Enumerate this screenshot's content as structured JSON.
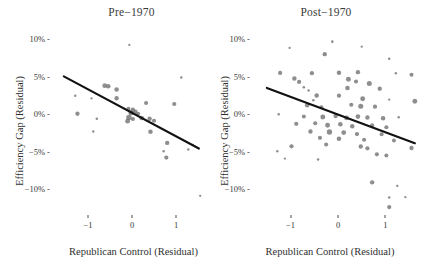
{
  "chart_data": {
    "type": "scatter",
    "title": "",
    "xlabel": "Republican Control (Residual)",
    "ylabel": "Efficiency Gap (Residual)",
    "grid": false,
    "legend": "none",
    "xlim": [
      -1.75,
      1.75
    ],
    "ylim": [
      -0.13,
      0.115
    ],
    "xticks": [
      -1,
      0,
      1
    ],
    "xtick_labels": [
      "−1",
      "0",
      "1"
    ],
    "yticks": [
      0.1,
      0.05,
      0.0,
      -0.05,
      -0.1
    ],
    "ytick_labels": [
      "10%",
      "5%",
      "0%",
      "−5%",
      "−10%"
    ],
    "point_color": "#6e6e6e",
    "point_opacity": 0.78,
    "line_color": "#111111",
    "note": "Bubble area encodes case weight; black line is fitted regression.",
    "panels": [
      {
        "id": "pre",
        "title": "Pre−1970",
        "fit_line": {
          "x1": -1.55,
          "y1": 0.0505,
          "x2": 1.52,
          "y2": -0.0455
        },
        "points": [
          {
            "x": -0.06,
            "y": 0.0925,
            "w": 1.0
          },
          {
            "x": 1.12,
            "y": 0.0492,
            "w": 1.2
          },
          {
            "x": -1.29,
            "y": 0.0248,
            "w": 1.1
          },
          {
            "x": -0.62,
            "y": 0.0382,
            "w": 4.2
          },
          {
            "x": -0.54,
            "y": 0.0375,
            "w": 4.0
          },
          {
            "x": -0.35,
            "y": 0.0332,
            "w": 3.8
          },
          {
            "x": -0.35,
            "y": 0.0215,
            "w": 3.6
          },
          {
            "x": -0.92,
            "y": 0.0212,
            "w": 1.0
          },
          {
            "x": 0.96,
            "y": 0.0138,
            "w": 3.4
          },
          {
            "x": 0.32,
            "y": 0.0152,
            "w": 3.2
          },
          {
            "x": -1.24,
            "y": 0.0008,
            "w": 3.5
          },
          {
            "x": -0.08,
            "y": 0.0075,
            "w": 3.0
          },
          {
            "x": 0.02,
            "y": 0.0062,
            "w": 3.6
          },
          {
            "x": -0.02,
            "y": 0.0022,
            "w": 5.2
          },
          {
            "x": 0.08,
            "y": 0.0035,
            "w": 3.4
          },
          {
            "x": 0.14,
            "y": 0.001,
            "w": 3.0
          },
          {
            "x": -0.07,
            "y": -0.0042,
            "w": 5.6
          },
          {
            "x": -0.1,
            "y": -0.009,
            "w": 4.4
          },
          {
            "x": 0.02,
            "y": -0.0062,
            "w": 3.2
          },
          {
            "x": 0.22,
            "y": -0.0048,
            "w": 4.0
          },
          {
            "x": 0.4,
            "y": -0.0058,
            "w": 3.8
          },
          {
            "x": 0.5,
            "y": -0.0085,
            "w": 3.4
          },
          {
            "x": -0.8,
            "y": -0.0058,
            "w": 1.2
          },
          {
            "x": -0.88,
            "y": -0.0228,
            "w": 1.1
          },
          {
            "x": 0.42,
            "y": -0.0232,
            "w": 3.9
          },
          {
            "x": 0.8,
            "y": -0.038,
            "w": 3.6
          },
          {
            "x": 1.38,
            "y": -0.0405,
            "w": 1.0
          },
          {
            "x": 0.72,
            "y": -0.0492,
            "w": 1.2
          },
          {
            "x": 1.28,
            "y": -0.0468,
            "w": 1.1
          },
          {
            "x": 0.78,
            "y": -0.0575,
            "w": 3.3
          },
          {
            "x": 1.55,
            "y": -0.1085,
            "w": 1.0
          }
        ]
      },
      {
        "id": "post",
        "title": "Post−1970",
        "fit_line": {
          "x1": -1.5,
          "y1": 0.0352,
          "x2": 1.62,
          "y2": -0.0385
        },
        "points": [
          {
            "x": -0.12,
            "y": 0.0968,
            "w": 1.3
          },
          {
            "x": -1.02,
            "y": 0.0885,
            "w": 1.0
          },
          {
            "x": 0.5,
            "y": 0.0902,
            "w": 1.0
          },
          {
            "x": -0.28,
            "y": 0.0802,
            "w": 3.6
          },
          {
            "x": 1.08,
            "y": 0.0742,
            "w": 1.2
          },
          {
            "x": -1.22,
            "y": 0.0552,
            "w": 3.4
          },
          {
            "x": -0.55,
            "y": 0.0548,
            "w": 3.5
          },
          {
            "x": 0.02,
            "y": 0.0555,
            "w": 3.8
          },
          {
            "x": 0.42,
            "y": 0.0562,
            "w": 3.6
          },
          {
            "x": 1.22,
            "y": 0.0548,
            "w": 1.1
          },
          {
            "x": 1.55,
            "y": 0.0528,
            "w": 3.2
          },
          {
            "x": -0.92,
            "y": 0.0478,
            "w": 3.8
          },
          {
            "x": -0.82,
            "y": 0.0432,
            "w": 3.4
          },
          {
            "x": 0.22,
            "y": 0.0468,
            "w": 4.6
          },
          {
            "x": 0.38,
            "y": 0.0438,
            "w": 3.2
          },
          {
            "x": 0.66,
            "y": 0.0412,
            "w": 4.8
          },
          {
            "x": -0.72,
            "y": 0.0362,
            "w": 1.2
          },
          {
            "x": -0.62,
            "y": 0.0318,
            "w": 1.1
          },
          {
            "x": 0.2,
            "y": 0.0352,
            "w": 4.0
          },
          {
            "x": 0.88,
            "y": 0.0342,
            "w": 3.6
          },
          {
            "x": -0.45,
            "y": 0.0252,
            "w": 3.8
          },
          {
            "x": -0.52,
            "y": 0.0188,
            "w": 1.2
          },
          {
            "x": 0.02,
            "y": 0.0248,
            "w": 3.4
          },
          {
            "x": 0.52,
            "y": 0.0208,
            "w": 4.6
          },
          {
            "x": 1.08,
            "y": 0.0195,
            "w": 1.0
          },
          {
            "x": 1.62,
            "y": 0.0175,
            "w": 4.4
          },
          {
            "x": -0.65,
            "y": 0.0122,
            "w": 3.8
          },
          {
            "x": -0.35,
            "y": 0.0095,
            "w": 3.2
          },
          {
            "x": 0.28,
            "y": 0.0128,
            "w": 3.2
          },
          {
            "x": 0.48,
            "y": 0.0108,
            "w": 4.8
          },
          {
            "x": 0.78,
            "y": 0.0102,
            "w": 3.4
          },
          {
            "x": -1.25,
            "y": 0.0002,
            "w": 1.1
          },
          {
            "x": -0.72,
            "y": -0.0028,
            "w": 3.0
          },
          {
            "x": -0.32,
            "y": -0.0035,
            "w": 4.6
          },
          {
            "x": -0.05,
            "y": -0.0022,
            "w": 3.6
          },
          {
            "x": 0.18,
            "y": -0.0048,
            "w": 4.2
          },
          {
            "x": 0.42,
            "y": -0.003,
            "w": 4.0
          },
          {
            "x": 0.62,
            "y": -0.0042,
            "w": 3.6
          },
          {
            "x": 0.95,
            "y": -0.0052,
            "w": 3.8
          },
          {
            "x": 1.28,
            "y": -0.0038,
            "w": 1.2
          },
          {
            "x": -0.88,
            "y": -0.0125,
            "w": 3.4
          },
          {
            "x": -0.48,
            "y": -0.0118,
            "w": 3.2
          },
          {
            "x": -0.22,
            "y": -0.0145,
            "w": 4.4
          },
          {
            "x": 0.05,
            "y": -0.0132,
            "w": 4.0
          },
          {
            "x": 0.3,
            "y": -0.0158,
            "w": 3.8
          },
          {
            "x": 0.72,
            "y": -0.0148,
            "w": 3.4
          },
          {
            "x": 1.02,
            "y": -0.0172,
            "w": 3.2
          },
          {
            "x": -0.58,
            "y": -0.0228,
            "w": 3.6
          },
          {
            "x": -0.18,
            "y": -0.0235,
            "w": 5.4
          },
          {
            "x": 0.12,
            "y": -0.0242,
            "w": 4.2
          },
          {
            "x": 0.4,
            "y": -0.0262,
            "w": 3.4
          },
          {
            "x": 0.92,
            "y": -0.0265,
            "w": 3.0
          },
          {
            "x": -0.38,
            "y": -0.0312,
            "w": 3.4
          },
          {
            "x": 0.02,
            "y": -0.0325,
            "w": 4.0
          },
          {
            "x": 0.55,
            "y": -0.0338,
            "w": 3.2
          },
          {
            "x": 1.18,
            "y": -0.0348,
            "w": 3.0
          },
          {
            "x": -0.98,
            "y": -0.0425,
            "w": 3.4
          },
          {
            "x": -0.25,
            "y": -0.0402,
            "w": 3.2
          },
          {
            "x": 0.48,
            "y": -0.0428,
            "w": 3.6
          },
          {
            "x": 0.62,
            "y": -0.0452,
            "w": 3.4
          },
          {
            "x": 1.55,
            "y": -0.0448,
            "w": 3.6
          },
          {
            "x": -1.28,
            "y": -0.0492,
            "w": 1.1
          },
          {
            "x": 0.82,
            "y": -0.0532,
            "w": 3.2
          },
          {
            "x": 1.02,
            "y": -0.0548,
            "w": 3.0
          },
          {
            "x": -1.12,
            "y": -0.0588,
            "w": 1.0
          },
          {
            "x": -0.42,
            "y": -0.0602,
            "w": 1.2
          },
          {
            "x": 0.72,
            "y": -0.0905,
            "w": 3.6
          },
          {
            "x": 1.25,
            "y": -0.0952,
            "w": 1.1
          },
          {
            "x": 1.08,
            "y": -0.1108,
            "w": 1.2
          },
          {
            "x": 1.42,
            "y": -0.1102,
            "w": 1.0
          },
          {
            "x": 1.08,
            "y": -0.1235,
            "w": 3.4
          }
        ]
      }
    ]
  }
}
